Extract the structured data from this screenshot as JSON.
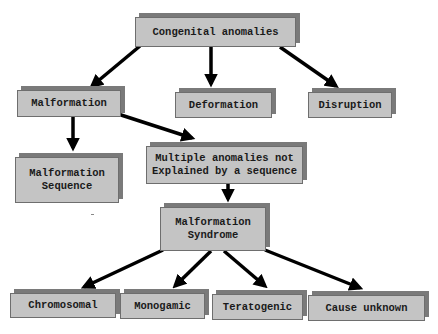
{
  "diagram": {
    "nodes": {
      "congenital_anomalies": "Congenital anomalies",
      "malformation": "Malformation",
      "deformation": "Deformation",
      "disruption": "Disruption",
      "malformation_sequence": "Malformation\nSequence",
      "multiple_anomalies": "Multiple anomalies not\nExplained by a sequence",
      "malformation_syndrome": "Malformation\nSyndrome",
      "chromosomal": "Chromosomal",
      "monogamic": "Monogamic",
      "teratogenic": "Teratogenic",
      "cause_unknown": "Cause unknown"
    },
    "edges": [
      {
        "from": "congenital_anomalies",
        "to": "malformation"
      },
      {
        "from": "congenital_anomalies",
        "to": "deformation"
      },
      {
        "from": "congenital_anomalies",
        "to": "disruption"
      },
      {
        "from": "malformation",
        "to": "malformation_sequence"
      },
      {
        "from": "malformation",
        "to": "multiple_anomalies"
      },
      {
        "from": "multiple_anomalies",
        "to": "malformation_syndrome"
      },
      {
        "from": "malformation_syndrome",
        "to": "chromosomal"
      },
      {
        "from": "malformation_syndrome",
        "to": "monogamic"
      },
      {
        "from": "malformation_syndrome",
        "to": "teratogenic"
      },
      {
        "from": "malformation_syndrome",
        "to": "cause_unknown"
      }
    ],
    "colors": {
      "box_fill": "#c4c4c4",
      "box_shadow": "#7a7a7a",
      "arrow": "#000000",
      "text": "#1a1a1a"
    }
  }
}
